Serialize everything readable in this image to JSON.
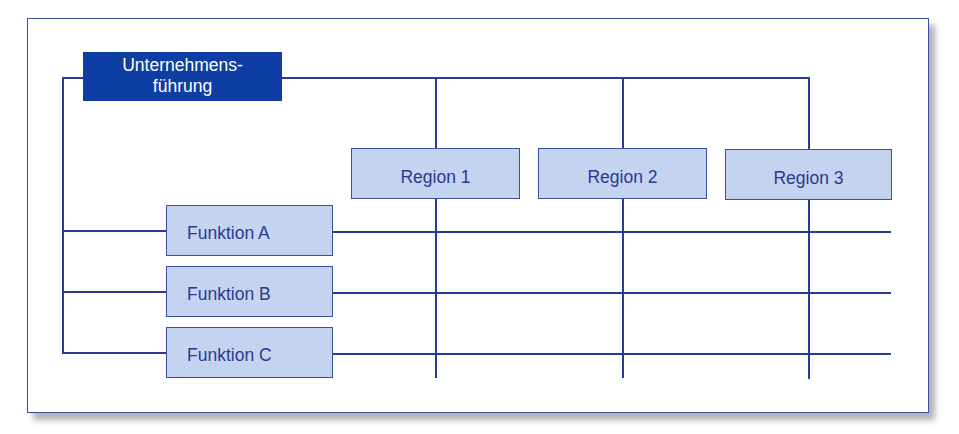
{
  "diagram": {
    "type": "matrix-organization",
    "head": {
      "line1": "Unternehmens-",
      "line2": "führung"
    },
    "regions": [
      {
        "label": "Region 1"
      },
      {
        "label": "Region 2"
      },
      {
        "label": "Region 3"
      }
    ],
    "functions": [
      {
        "label": "Funktion A"
      },
      {
        "label": "Funktion B"
      },
      {
        "label": "Funktion C"
      }
    ],
    "colors": {
      "head_fill": "#0e3da3",
      "box_fill": "#c3d3f0",
      "line": "#2a3a9a",
      "text": "#2c3a8f"
    }
  }
}
